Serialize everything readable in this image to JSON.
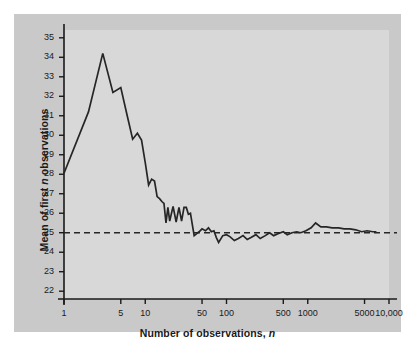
{
  "figure": {
    "panel_bg": "#c9c9c9",
    "plot_bg": "#d8d8d8",
    "axis_color": "#1a1a1a",
    "line_color": "#262626",
    "page_bg": "#ffffff"
  },
  "chart_data": {
    "type": "line",
    "title": "",
    "xlabel": "Number of observations, n",
    "ylabel": "Mean of first n observations",
    "xscale": "log",
    "xlim": [
      1,
      10000
    ],
    "ylim": [
      21.6,
      35.4
    ],
    "grid": false,
    "legend": null,
    "yticks": [
      35,
      34,
      33,
      32,
      31,
      30,
      29,
      28,
      27,
      26,
      25,
      24,
      23,
      22
    ],
    "ytick_labels": [
      "35",
      "34",
      "33",
      "32",
      "31",
      "30",
      "29",
      "28",
      "27",
      "26",
      "25",
      "24",
      "23",
      "22"
    ],
    "xticks": [
      1,
      5,
      10,
      50,
      100,
      500,
      1000,
      5000,
      10000
    ],
    "xtick_labels": [
      "1",
      "5",
      "10",
      "50",
      "100",
      "500",
      "1000",
      "5000",
      "10,000"
    ],
    "reference_line": {
      "value": 25,
      "style": "dashed",
      "orientation": "horizontal",
      "label": ""
    },
    "series": [
      {
        "name": "Running mean",
        "x": [
          1,
          2,
          3,
          4,
          5,
          6,
          7,
          8,
          9,
          10,
          11,
          12,
          13,
          14,
          15,
          16,
          17,
          18,
          19,
          20,
          22,
          24,
          26,
          28,
          30,
          32,
          34,
          36,
          38,
          40,
          43,
          46,
          50,
          55,
          60,
          65,
          70,
          75,
          80,
          90,
          100,
          110,
          125,
          140,
          160,
          180,
          200,
          230,
          260,
          300,
          340,
          380,
          430,
          500,
          560,
          640,
          730,
          820,
          950,
          1100,
          1250,
          1450,
          1700,
          2000,
          2400,
          2800,
          3300,
          3900,
          4600,
          5400,
          6300,
          7000
        ],
        "y": [
          28.05,
          31.2,
          34.2,
          32.2,
          32.45,
          31.0,
          29.8,
          30.1,
          29.75,
          28.6,
          27.45,
          27.75,
          27.65,
          26.85,
          26.75,
          26.6,
          26.5,
          25.5,
          26.3,
          25.6,
          26.35,
          25.55,
          26.3,
          25.6,
          26.3,
          26.3,
          25.95,
          26.0,
          25.4,
          24.85,
          24.95,
          25.05,
          25.2,
          25.1,
          25.25,
          25.05,
          25.1,
          24.75,
          24.5,
          24.85,
          24.9,
          24.8,
          24.6,
          24.7,
          24.85,
          24.65,
          24.75,
          24.9,
          24.7,
          24.85,
          25.0,
          24.85,
          24.95,
          25.05,
          24.9,
          25.0,
          25.05,
          25.0,
          25.1,
          25.25,
          25.5,
          25.3,
          25.3,
          25.25,
          25.25,
          25.2,
          25.2,
          25.15,
          25.05,
          25.1,
          25.05,
          25.05
        ]
      }
    ]
  }
}
